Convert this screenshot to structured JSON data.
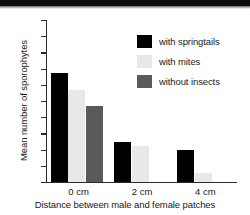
{
  "chart_data": {
    "type": "bar",
    "title": "",
    "xlabel": "Distance between male and female patches",
    "ylabel": "Mean number of sporophytes",
    "categories": [
      "0 cm",
      "2 cm",
      "4 cm"
    ],
    "series": [
      {
        "name": "with springtails",
        "color": "#000000",
        "values": [
          6.7,
          2.45,
          1.95
        ]
      },
      {
        "name": "with mites",
        "color": "#e8e8e8",
        "values": [
          5.65,
          2.2,
          0.55
        ]
      },
      {
        "name": "without insects",
        "color": "#5a5a5a",
        "values": [
          4.7,
          0,
          0
        ]
      }
    ],
    "ylim": [
      0,
      10
    ],
    "yticks": [
      0,
      1,
      2,
      3,
      4,
      5,
      6,
      7,
      8,
      9,
      10
    ],
    "ytick_labels": [
      "0",
      "1",
      "2",
      "3",
      "4",
      "5",
      "6",
      "7",
      "8",
      "9",
      "10"
    ],
    "grid": false,
    "legend_position": "upper right"
  },
  "legend": {
    "items": [
      {
        "label": "with springtails",
        "color": "#000000"
      },
      {
        "label": "with mites",
        "color": "#e8e8e8"
      },
      {
        "label": "without insects",
        "color": "#5a5a5a"
      }
    ]
  }
}
